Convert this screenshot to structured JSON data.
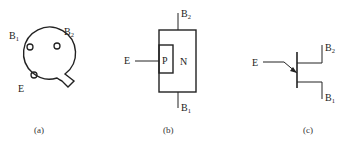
{
  "panels": {
    "a": {
      "caption": "(a)",
      "labels": {
        "b1": "B",
        "b1_sub": "1",
        "b2": "B",
        "b2_sub": "2",
        "e": "E"
      },
      "description": "bottom view of package with three pins and tab"
    },
    "b": {
      "caption": "(b)",
      "labels": {
        "b2": "B",
        "b2_sub": "2",
        "b1": "B",
        "b1_sub": "1",
        "e": "E",
        "p": "P",
        "n": "N"
      },
      "description": "structure: P region embedded in N bar"
    },
    "c": {
      "caption": "(c)",
      "labels": {
        "e": "E",
        "b2": "B",
        "b2_sub": "2",
        "b1": "B",
        "b1_sub": "1"
      },
      "description": "unijunction transistor circuit symbol"
    }
  }
}
